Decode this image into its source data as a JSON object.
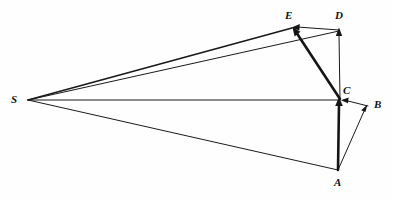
{
  "figure": {
    "type": "geometric-vector-diagram",
    "background_color": "#fefefe",
    "stroke_color": "#151515",
    "width": 393,
    "height": 199
  },
  "points": [
    {
      "id": "S",
      "label": "S",
      "x": 28,
      "y": 100,
      "label_x": 11,
      "label_y": 94
    },
    {
      "id": "A",
      "label": "A",
      "x": 338,
      "y": 170,
      "label_x": 334,
      "label_y": 177
    },
    {
      "id": "B",
      "label": "B",
      "x": 368,
      "y": 106,
      "label_x": 374,
      "label_y": 99
    },
    {
      "id": "C",
      "label": "C",
      "x": 340,
      "y": 100,
      "label_x": 343,
      "label_y": 85
    },
    {
      "id": "D",
      "label": "D",
      "x": 339,
      "y": 30,
      "label_x": 335,
      "label_y": 10
    },
    {
      "id": "E",
      "label": "E",
      "x": 292,
      "y": 28,
      "label_x": 285,
      "label_y": 10
    }
  ],
  "edges": [
    {
      "id": "S-E",
      "from": "S",
      "to": "E",
      "weight": "medium",
      "arrow": false
    },
    {
      "id": "S-D",
      "from": "S",
      "to": "D",
      "weight": "thin",
      "arrow": false
    },
    {
      "id": "S-C",
      "from": "S",
      "to": "C",
      "weight": "thin",
      "arrow": false
    },
    {
      "id": "S-A",
      "from": "S",
      "to": "A",
      "weight": "thin",
      "arrow": false
    },
    {
      "id": "A-C",
      "from": "A",
      "to": "C",
      "weight": "thick",
      "arrow": true
    },
    {
      "id": "A-B",
      "from": "A",
      "to": "B",
      "weight": "thin",
      "arrow": true
    },
    {
      "id": "B-C",
      "from": "B",
      "to": "C",
      "weight": "thin",
      "arrow": true
    },
    {
      "id": "C-D",
      "from": "C",
      "to": "D",
      "weight": "thin",
      "arrow": true
    },
    {
      "id": "C-E",
      "from": "C",
      "to": "E",
      "weight": "thick",
      "arrow": true
    },
    {
      "id": "D-E",
      "from": "D",
      "to": "E",
      "weight": "thin",
      "arrow": true
    }
  ],
  "labels": {
    "S": "S",
    "A": "A",
    "B": "B",
    "C": "C",
    "D": "D",
    "E": "E"
  }
}
